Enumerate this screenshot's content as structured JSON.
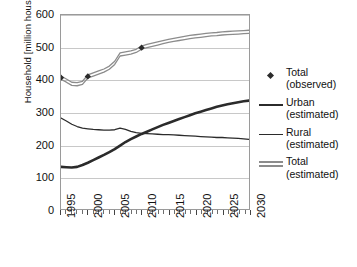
{
  "chart_data": {
    "type": "line",
    "title": "",
    "xlabel": "",
    "ylabel": "Household [million household]",
    "xlim": [
      1995,
      2030
    ],
    "ylim": [
      0,
      600
    ],
    "yticks": [
      0,
      100,
      200,
      300,
      400,
      500,
      600
    ],
    "xticks": [
      1995,
      2000,
      2005,
      2010,
      2015,
      2020,
      2025,
      2030
    ],
    "xtick_labels": [
      "1995",
      "2000",
      "2005",
      "2010",
      "2015",
      "2020",
      "2025",
      "2030"
    ],
    "ytick_labels": [
      "0",
      "100",
      "200",
      "300",
      "400",
      "500",
      "600"
    ],
    "grid": "horizontal",
    "legend_position": "right",
    "x": [
      1995,
      1996,
      1997,
      1998,
      1999,
      2000,
      2001,
      2002,
      2003,
      2004,
      2005,
      2006,
      2007,
      2008,
      2009,
      2010,
      2011,
      2012,
      2013,
      2014,
      2015,
      2016,
      2017,
      2018,
      2019,
      2020,
      2021,
      2022,
      2023,
      2024,
      2025,
      2026,
      2027,
      2028,
      2029,
      2030
    ],
    "series": [
      {
        "name": "Total (estimated)",
        "style": "double-line",
        "color": "#8c8c8c",
        "values": [
          406,
          397,
          387,
          386,
          390,
          410,
          416,
          422,
          428,
          437,
          452,
          478,
          481,
          484,
          489,
          499,
          504,
          508,
          512,
          516,
          520,
          523,
          526,
          529,
          532,
          534,
          536,
          538,
          540,
          541,
          543,
          544,
          545,
          546,
          547,
          548
        ]
      },
      {
        "name": "Urban (estimated)",
        "style": "thick-line",
        "color": "#2b2b2b",
        "values": [
          130,
          129,
          128,
          130,
          136,
          143,
          151,
          159,
          167,
          176,
          185,
          196,
          207,
          216,
          224,
          232,
          239,
          246,
          253,
          260,
          266,
          272,
          278,
          284,
          290,
          296,
          301,
          306,
          311,
          316,
          320,
          324,
          327,
          330,
          333,
          335
        ]
      },
      {
        "name": "Rural (estimated)",
        "style": "thin-line",
        "color": "#2b2b2b",
        "values": [
          281,
          272,
          262,
          255,
          250,
          248,
          246,
          245,
          244,
          244,
          245,
          250,
          246,
          240,
          236,
          234,
          233,
          232,
          231,
          230,
          230,
          229,
          228,
          227,
          226,
          225,
          224,
          223,
          222,
          221,
          221,
          220,
          219,
          218,
          217,
          215
        ]
      }
    ],
    "observed_points": {
      "name": "Total (observed)",
      "marker": "diamond",
      "color": "#2b2b2b",
      "points": [
        {
          "x": 1995,
          "y": 406
        },
        {
          "x": 2000,
          "y": 410
        },
        {
          "x": 2010,
          "y": 499
        }
      ]
    },
    "legend_entries": [
      {
        "line1": "Total",
        "line2": "(observed)",
        "symbol": "diamond-marker"
      },
      {
        "line1": "Urban",
        "line2": "(estimated)",
        "symbol": "thick-line"
      },
      {
        "line1": "Rural",
        "line2": "(estimated)",
        "symbol": "thin-line"
      },
      {
        "line1": "Total",
        "line2": "(estimated)",
        "symbol": "double-line"
      }
    ]
  }
}
